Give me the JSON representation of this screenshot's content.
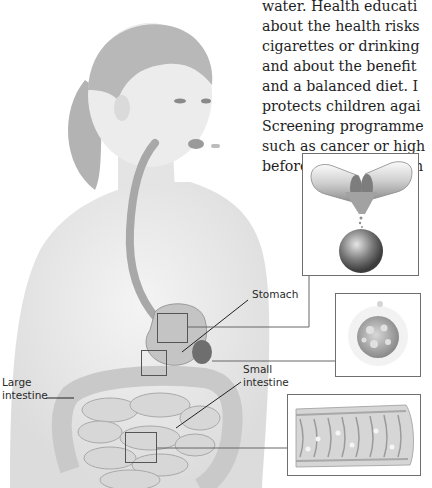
{
  "body_text": {
    "lines": [
      "water. Health educati",
      "about the health risks",
      "cigarettes or drinking",
      "and about the benefit",
      "and a balanced diet. I",
      "protects children agai",
      "Screening programme",
      "such as cancer or high",
      "before they cause sym"
    ]
  },
  "labels": {
    "stomach": "Stomach",
    "small_intestine": [
      "Small",
      "intestine"
    ],
    "large_intestine": [
      "Large",
      "intestine"
    ]
  },
  "insets": [
    {
      "name": "capsule-and-pill",
      "subject": "opened capsule releasing granules and a round pill"
    },
    {
      "name": "dissolving-particle",
      "subject": "spherical particle dissolving"
    },
    {
      "name": "intestine-wall",
      "subject": "section of intestinal wall with villi"
    }
  ],
  "colors": {
    "text": "#1e1e1e",
    "frame": "#6f6f6f",
    "leader": "#555555",
    "skin": "#e9e9e9",
    "organ": "#bdbdbd"
  }
}
